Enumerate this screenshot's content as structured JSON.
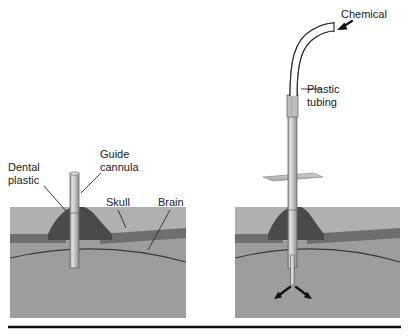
{
  "figure": {
    "type": "diagram",
    "panels": [
      {
        "id": "left",
        "name": "implanted-guide-cannula",
        "labels": [
          "Dental plastic",
          "Guide cannula",
          "Skull",
          "Brain"
        ]
      },
      {
        "id": "right",
        "name": "injection-in-progress",
        "labels": [
          "Chemical",
          "Plastic tubing"
        ]
      }
    ]
  },
  "labels": {
    "dental_plastic_line1": "Dental",
    "dental_plastic_line2": "plastic",
    "guide_cannula_line1": "Guide",
    "guide_cannula_line2": "cannula",
    "skull": "Skull",
    "brain": "Brain",
    "chemical": "Chemical",
    "plastic_tubing_line1": "Plastic",
    "plastic_tubing_line2": "tubing"
  },
  "colors": {
    "scalp": "#b0b0b0",
    "skull_band": "#6e6e6e",
    "brain": "#9d9d9d",
    "dental_plastic": "#4a4a4a",
    "cannula_fill": "#c8c8c8",
    "cannula_edge": "#6a6a6a",
    "outline": "#2b2b2b",
    "text": "#1a1a1a",
    "background": "#ffffff",
    "bottom_rule": "#111111"
  },
  "anatomy": {
    "layers": [
      "scalp",
      "skull",
      "brain"
    ],
    "brain_surface_curve": true,
    "diffusion_arrows": 2
  }
}
